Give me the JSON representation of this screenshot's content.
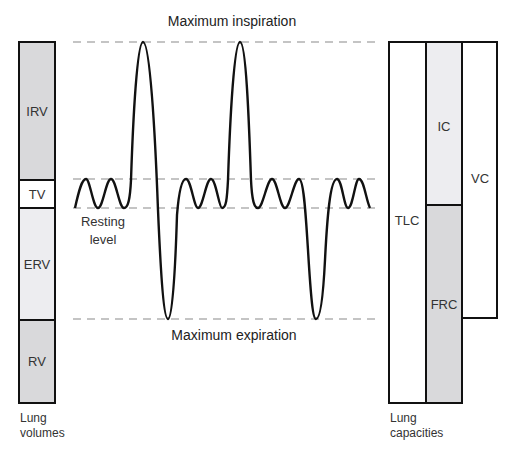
{
  "colors": {
    "stroke": "#111111",
    "dash": "#888888",
    "gray_fill": "#d9d9db",
    "light_fill": "#ededf0",
    "white_fill": "#ffffff"
  },
  "annotations": {
    "max_inspiration": "Maximum inspiration",
    "max_expiration": "Maximum expiration",
    "resting_line1": "Resting",
    "resting_line2": "level"
  },
  "lung_volumes": {
    "caption_line1": "Lung",
    "caption_line2": "volumes",
    "segments": [
      {
        "label": "IRV",
        "y_top": 42,
        "y_bottom": 180,
        "fill": "gray"
      },
      {
        "label": "TV",
        "y_top": 180,
        "y_bottom": 208,
        "fill": "white"
      },
      {
        "label": "ERV",
        "y_top": 208,
        "y_bottom": 320,
        "fill": "light"
      },
      {
        "label": "RV",
        "y_top": 320,
        "y_bottom": 403,
        "fill": "gray"
      }
    ]
  },
  "lung_capacities": {
    "caption_line1": "Lung",
    "caption_line2": "capacities",
    "bars": [
      {
        "label": "TLC",
        "y_top": 42,
        "y_bottom": 403,
        "fill": "white"
      },
      {
        "label": "IC",
        "y_top": 42,
        "y_bottom": 205,
        "fill": "light"
      },
      {
        "label": "FRC",
        "y_top": 205,
        "y_bottom": 403,
        "fill": "gray"
      },
      {
        "label": "VC",
        "y_top": 42,
        "y_bottom": 318,
        "fill": "white"
      }
    ]
  },
  "levels": {
    "max_inspiration_y": 42,
    "tidal_top_y": 179,
    "resting_y": 208,
    "max_expiration_y": 319
  }
}
